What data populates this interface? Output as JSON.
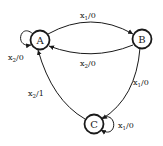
{
  "diagram": {
    "type": "state-machine",
    "nodes": [
      {
        "id": "A",
        "label": "A",
        "x": 40,
        "y": 40
      },
      {
        "id": "B",
        "label": "B",
        "x": 142,
        "y": 39
      },
      {
        "id": "C",
        "label": "C",
        "x": 94,
        "y": 124
      }
    ],
    "edges": [
      {
        "from": "A",
        "to": "B",
        "input": "x",
        "input_sub": "1",
        "output": "/0"
      },
      {
        "from": "B",
        "to": "A",
        "input": "x",
        "input_sub": "2",
        "output": "/0"
      },
      {
        "from": "A",
        "to": "A",
        "input": "x",
        "input_sub": "2",
        "output": "/0"
      },
      {
        "from": "B",
        "to": "C",
        "input": "x",
        "input_sub": "1",
        "output": "/0"
      },
      {
        "from": "C",
        "to": "A",
        "input": "x",
        "input_sub": "2",
        "output": "/1"
      },
      {
        "from": "C",
        "to": "C",
        "input": "x",
        "input_sub": "1",
        "output": "/0"
      }
    ]
  }
}
